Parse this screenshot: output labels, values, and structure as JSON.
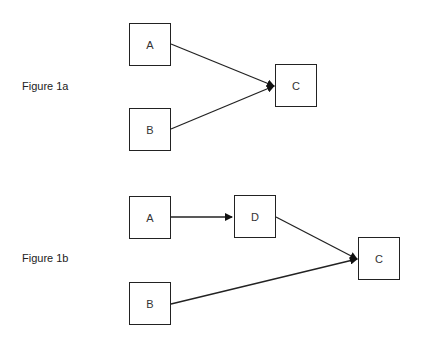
{
  "figures": [
    {
      "label": "Figure 1a",
      "nodes": [
        {
          "id": "A",
          "label": "A"
        },
        {
          "id": "B",
          "label": "B"
        },
        {
          "id": "C",
          "label": "C"
        }
      ],
      "edges": [
        {
          "from": "A",
          "to": "C"
        },
        {
          "from": "B",
          "to": "C"
        }
      ]
    },
    {
      "label": "Figure 1b",
      "nodes": [
        {
          "id": "A",
          "label": "A"
        },
        {
          "id": "D",
          "label": "D"
        },
        {
          "id": "B",
          "label": "B"
        },
        {
          "id": "C",
          "label": "C"
        }
      ],
      "edges": [
        {
          "from": "A",
          "to": "D"
        },
        {
          "from": "D",
          "to": "C"
        },
        {
          "from": "B",
          "to": "C"
        }
      ]
    }
  ],
  "colors": {
    "stroke": "#222222",
    "background": "#ffffff"
  }
}
